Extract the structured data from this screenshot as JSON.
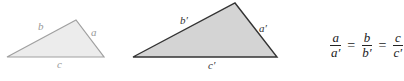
{
  "small_triangle": {
    "fill": "#ececec",
    "stroke": "#a0a0a0",
    "points": "7,57 76,20 104,57",
    "labels": {
      "a": "a",
      "b": "b",
      "c": "c"
    }
  },
  "large_triangle": {
    "fill": "#d4d4d4",
    "stroke": "#333333",
    "points": "133,57 235,3 277,57",
    "labels": {
      "a": "a′",
      "b": "b′",
      "c": "c′"
    }
  },
  "equation": {
    "fractions": [
      {
        "num": "a",
        "den": "a′"
      },
      {
        "num": "b",
        "den": "b′"
      },
      {
        "num": "c",
        "den": "c′"
      }
    ],
    "operator": "="
  }
}
